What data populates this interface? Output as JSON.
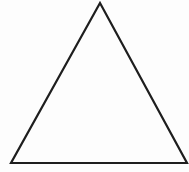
{
  "diagram": {
    "shape": "triangle",
    "kind": "equilateral-outline",
    "vertices": {
      "apex": [
        100,
        3
      ],
      "bottom_left": [
        11,
        163
      ],
      "bottom_right": [
        187,
        163
      ]
    },
    "stroke_color": "#1e1e1e",
    "stroke_width": 2.2,
    "fill": "none",
    "background": "#fdfdfd"
  }
}
